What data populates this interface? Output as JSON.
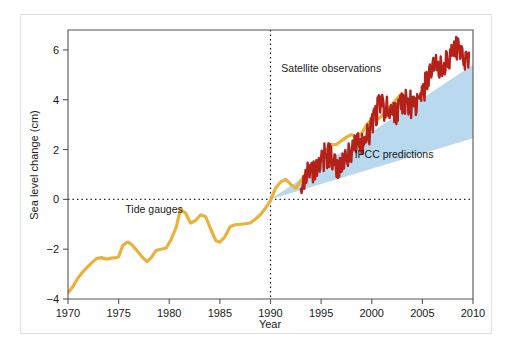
{
  "chart_data": {
    "type": "line",
    "title": "",
    "xlabel": "Year",
    "ylabel": "Sea level change (cm)",
    "xlim": [
      1970,
      2010
    ],
    "ylim": [
      -4,
      6.8
    ],
    "xticks": [
      1970,
      1975,
      1980,
      1985,
      1990,
      1995,
      2000,
      2005,
      2010
    ],
    "yticks": [
      -4,
      -2,
      0,
      2,
      4,
      6
    ],
    "xtick_labels": [
      "1970",
      "1975",
      "1980",
      "1985",
      "1990",
      "1995",
      "2000",
      "2005",
      "2010"
    ],
    "ytick_labels": [
      "-4",
      "-2",
      "0",
      "2",
      "4",
      "6"
    ],
    "grid": false,
    "legend_position": "inline-annotations",
    "reference_lines": [
      {
        "name": "zero-line",
        "orientation": "horizontal",
        "value": 0,
        "style": "dotted",
        "color": "#1a1a1a"
      },
      {
        "name": "year-1990-line",
        "orientation": "vertical",
        "value": 1990,
        "style": "dotted",
        "color": "#1a1a1a"
      }
    ],
    "annotations": [
      {
        "name": "tide-gauges-label",
        "text": "Tide gauges",
        "x": 1978.5,
        "y": -0.55
      },
      {
        "name": "satellite-observations-label",
        "text": "Satellite observations",
        "x": 1996.0,
        "y": 5.1
      },
      {
        "name": "ipcc-predictions-label",
        "text": "IPCC predictions",
        "x": 2002.2,
        "y": 1.65
      }
    ],
    "series": [
      {
        "name": "Tide gauges",
        "type": "line",
        "color": "#e8b33c",
        "x": [
          1970.0,
          1970.4,
          1971.0,
          1971.6,
          1972.2,
          1972.8,
          1973.3,
          1973.8,
          1974.3,
          1974.8,
          1975.0,
          1975.4,
          1975.9,
          1976.3,
          1976.8,
          1977.3,
          1977.8,
          1978.2,
          1978.7,
          1979.2,
          1979.7,
          1980.2,
          1980.7,
          1981.1,
          1981.6,
          1982.1,
          1982.6,
          1983.1,
          1983.6,
          1984.1,
          1984.6,
          1985.0,
          1985.5,
          1986.0,
          1986.5,
          1987.0,
          1987.5,
          1988.0,
          1988.5,
          1989.0,
          1989.5,
          1990.0,
          1990.5,
          1991.0,
          1991.5,
          1992.0,
          1992.5,
          1993.0,
          1993.5,
          1994.0,
          1994.5,
          1995.0,
          1995.5,
          1996.0,
          1996.5,
          1997.0,
          1997.5,
          1998.0,
          1998.5,
          1999.0,
          1999.5,
          2000.0,
          2000.5,
          2001.0,
          2001.5,
          2002.0,
          2002.5,
          2003.0
        ],
        "y": [
          -3.75,
          -3.55,
          -3.15,
          -2.85,
          -2.6,
          -2.38,
          -2.34,
          -2.4,
          -2.36,
          -2.34,
          -2.3,
          -1.85,
          -1.72,
          -1.82,
          -2.05,
          -2.3,
          -2.5,
          -2.35,
          -2.05,
          -2.0,
          -1.95,
          -1.6,
          -1.1,
          -0.4,
          -0.55,
          -0.95,
          -0.85,
          -0.62,
          -0.7,
          -1.2,
          -1.65,
          -1.72,
          -1.5,
          -1.1,
          -1.02,
          -1.0,
          -0.98,
          -0.95,
          -0.8,
          -0.62,
          -0.35,
          -0.05,
          0.45,
          0.7,
          0.8,
          0.6,
          0.45,
          0.75,
          1.05,
          1.3,
          1.35,
          1.55,
          1.95,
          2.2,
          2.2,
          2.35,
          2.5,
          2.6,
          2.5,
          2.65,
          3.0,
          3.2,
          3.2,
          3.35,
          3.6,
          3.8,
          4.05,
          4.25
        ]
      },
      {
        "name": "Satellite observations",
        "type": "line",
        "color": "#b42118",
        "x_start": 1993.0,
        "x_end": 2009.6,
        "y_start": 0.45,
        "y_end": 6.1,
        "trend_cm_per_year": 0.34,
        "noise_amplitude_cm": 0.55,
        "description": "Noisy rising satellite altimetry record from 1993 to 2009.6"
      }
    ],
    "bands": [
      {
        "name": "IPCC predictions",
        "type": "wedge",
        "color": "#b8d9ee",
        "apex_x": 1990,
        "apex_y": 0.0,
        "end_x": 2010,
        "end_upper_y": 5.4,
        "end_lower_y": 2.45
      }
    ]
  },
  "axes": {
    "xlabel": "Year",
    "ylabel": "Sea level change (cm)"
  }
}
